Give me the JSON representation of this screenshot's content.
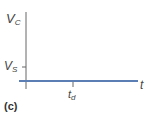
{
  "figure": {
    "panel_label": "(c)",
    "y_axis_label": "V",
    "y_axis_label_sub": "C",
    "x_axis_label": "t",
    "y_tick_label": "V",
    "y_tick_label_sub": "S",
    "x_tick_label": "t",
    "x_tick_label_sub": "d",
    "line_color": "#5b7fb5",
    "axis_color": "#555555"
  }
}
